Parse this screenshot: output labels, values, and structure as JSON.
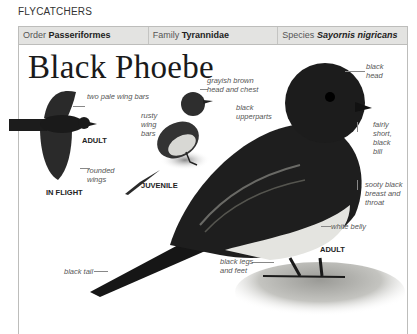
{
  "section_heading": "FLYCATCHERS",
  "taxonomy": {
    "order_label": "Order",
    "order_value": "Passeriformes",
    "family_label": "Family",
    "family_value": "Tyrannidae",
    "species_label": "Species",
    "species_value": "Sayornis nigricans"
  },
  "title": "Black Phoebe",
  "figures": {
    "flight": {
      "caption": "IN FLIGHT",
      "age_tag": "ADULT",
      "labels": [
        "two pale wing bars",
        "rounded wings"
      ]
    },
    "juvenile": {
      "caption": "JUVENILE",
      "labels": [
        "grayish brown head and chest",
        "rusty wing bars"
      ]
    },
    "adult": {
      "caption": "ADULT",
      "labels": [
        "black upperparts",
        "black head",
        "fairly short, black bill",
        "sooty black breast and throat",
        "white belly",
        "black legs and feet",
        "black tail"
      ]
    }
  }
}
